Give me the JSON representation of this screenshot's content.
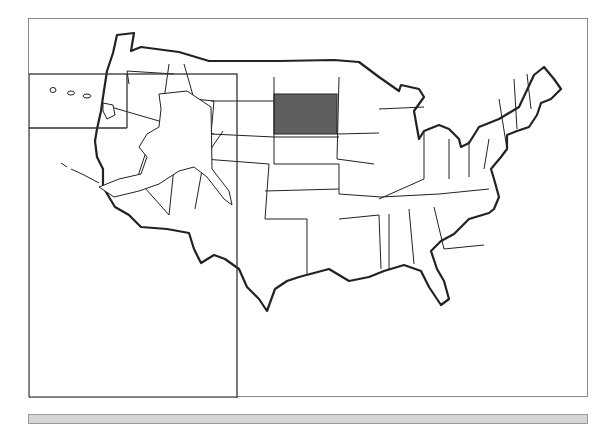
{
  "map": {
    "title": "",
    "highlighted_region": "South Dakota",
    "highlight_color": "#5f5f5f",
    "outline_color": "#222222",
    "frame_color": "#8a8a8a",
    "insets": [
      "Hawaii",
      "Alaska"
    ]
  },
  "answer_bar": {
    "text": "",
    "color": "#d6d6d6"
  }
}
